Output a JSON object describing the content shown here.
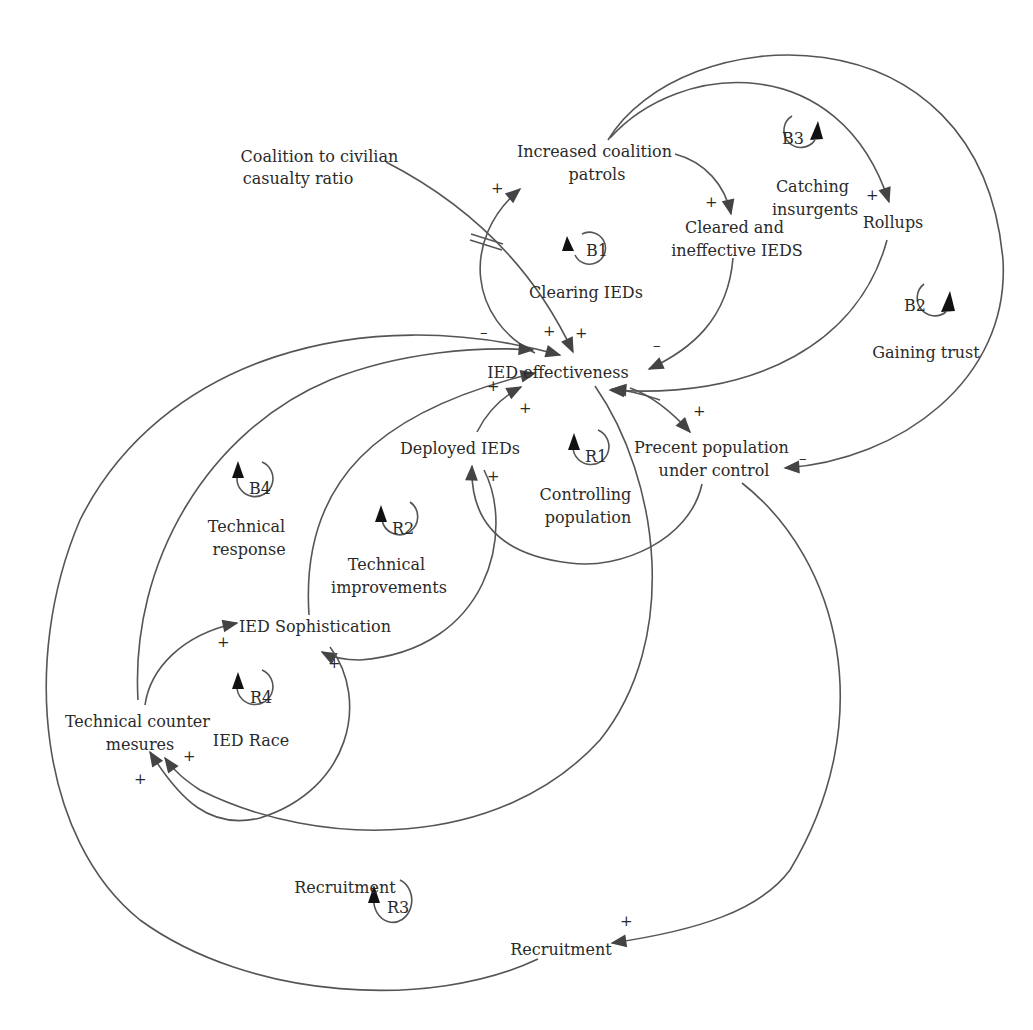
{
  "colors": {
    "line": "#555555",
    "arrow": "#444444",
    "text": "#2a2a2a",
    "background": "#ffffff"
  },
  "nodes": {
    "coalition_ratio": {
      "lines": [
        "Coalition to civilian",
        "casualty ratio"
      ]
    },
    "coalition_patrols": {
      "lines": [
        "Increased coalition",
        "patrols"
      ]
    },
    "cleared_ieds": {
      "lines": [
        "Cleared and",
        "ineffective IEDS"
      ]
    },
    "rollups": {
      "lines": [
        "Rollups"
      ]
    },
    "ied_effectiveness": {
      "lines": [
        "IED effectiveness"
      ]
    },
    "deployed_ieds": {
      "lines": [
        "Deployed IEDs"
      ]
    },
    "population_control": {
      "lines": [
        "Precent population",
        "under control"
      ]
    },
    "ied_sophistication": {
      "lines": [
        "IED Sophistication"
      ]
    },
    "counter_measures": {
      "lines": [
        "Technical counter",
        "mesures"
      ]
    },
    "recruitment_label": {
      "lines": [
        "Recruitment"
      ]
    },
    "recruitment": {
      "lines": [
        "Recruitment"
      ]
    }
  },
  "loops": {
    "B1": {
      "id": "B1",
      "name": [
        "Clearing IEDs"
      ]
    },
    "B2": {
      "id": "B2",
      "name": [
        "Gaining trust"
      ]
    },
    "B3": {
      "id": "B3",
      "name": [
        "Catching",
        "insurgents"
      ]
    },
    "B4": {
      "id": "B4",
      "name": [
        "Technical",
        "response"
      ]
    },
    "R1": {
      "id": "R1",
      "name": [
        "Controlling",
        "population"
      ]
    },
    "R2": {
      "id": "R2",
      "name": [
        "Technical",
        "improvements"
      ]
    },
    "R3": {
      "id": "R3",
      "name": []
    },
    "R4": {
      "id": "R4",
      "name": [
        "IED Race"
      ]
    }
  },
  "polarities": {
    "patrols_in": "+",
    "cleared_in": "+",
    "rollups_in": "+",
    "eff_minus_left": "–",
    "eff_plus_a": "+",
    "eff_plus_b": "+",
    "eff_minus_right": "–",
    "eff_plus_left": "+",
    "eff_plus_deployed": "+",
    "pop_in": "+",
    "pop_minus": "–",
    "deployed_in": "+",
    "soph_in_left": "+",
    "soph_in_right": "+",
    "counter_in_a": "+",
    "counter_in_b": "+",
    "recruit_in": "+"
  }
}
